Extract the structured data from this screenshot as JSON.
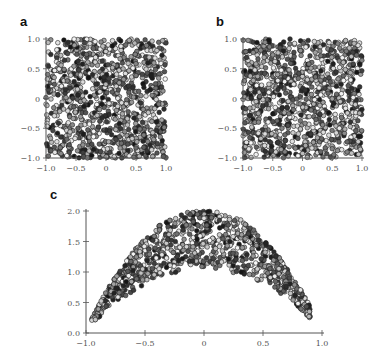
{
  "figure": {
    "panels": [
      {
        "id": "a",
        "label": "a"
      },
      {
        "id": "b",
        "label": "b"
      },
      {
        "id": "c",
        "label": "c"
      }
    ]
  },
  "chart_data": [
    {
      "panel": "a",
      "type": "scatter",
      "title": "",
      "xlabel": "",
      "ylabel": "",
      "xlim": [
        -1.0,
        1.0
      ],
      "ylim": [
        -1.0,
        1.0
      ],
      "xticks": [
        "-1.0",
        "-0.5",
        "0",
        "0.5",
        "1.0"
      ],
      "yticks": [
        "-1.0",
        "-0.5",
        "0",
        "0.5",
        "1.0"
      ],
      "grid": false,
      "description": "Approximately 1000 points uniformly distributed over the square [-1,1]x[-1,1]; marker fill shaded from white to black (grayscale color value)",
      "n_points": 1000,
      "distribution": "uniform_square"
    },
    {
      "panel": "b",
      "type": "scatter",
      "title": "",
      "xlabel": "",
      "ylabel": "",
      "xlim": [
        -1.0,
        1.0
      ],
      "ylim": [
        -1.0,
        1.0
      ],
      "xticks": [
        "-1.0",
        "-0.5",
        "0",
        "0.5",
        "1.0"
      ],
      "yticks": [
        "-1.0",
        "-0.5",
        "0",
        "0.5",
        "1.0"
      ],
      "grid": false,
      "description": "Approximately 1000 points over the square [-1,1]x[-1,1], slightly denser in the center-left; grayscale-shaded circular markers",
      "n_points": 1000,
      "distribution": "uniform_square"
    },
    {
      "panel": "c",
      "type": "scatter",
      "title": "",
      "xlabel": "",
      "ylabel": "",
      "xlim": [
        -1.0,
        1.0
      ],
      "ylim": [
        0.0,
        2.0
      ],
      "xticks": [
        "-1.0",
        "-0.5",
        "0",
        "0.5",
        "1.0"
      ],
      "yticks": [
        "0.0",
        "0.5",
        "1.0",
        "1.5",
        "2.0"
      ],
      "grid": false,
      "description": "Points forming an arch band: y between ~(1.1 - 1.1x^2)+ ... upper edge ~2 - 1.9x^2, lower edge ~1.1 - 1.0x^2; x range approx -0.95 to 0.9",
      "n_points": 1000,
      "distribution": "parabolic_band",
      "band": {
        "upper": "2.0 - 2.0*x^2",
        "lower": "1.05 - 1.0*x^2 (clipped to >= 0.2)"
      },
      "extreme_points": [
        {
          "x": -0.95,
          "y": 0.21
        },
        {
          "x": -0.92,
          "y": 0.22
        },
        {
          "x": 0.89,
          "y": 0.27
        }
      ]
    }
  ],
  "style": {
    "marker_edge": "#222222",
    "marker_fill_range": [
      "#ffffff",
      "#111111"
    ],
    "axis_color": "#555555",
    "tick_label_color": "#555555"
  }
}
